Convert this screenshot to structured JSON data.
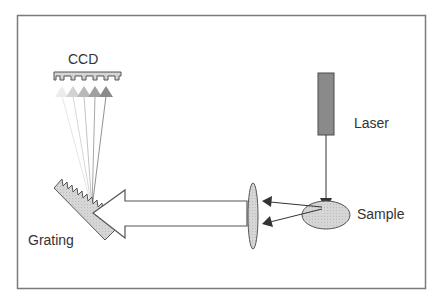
{
  "diagram": {
    "type": "raman-spectrometer-schematic",
    "labels": {
      "ccd": "CCD",
      "laser": "Laser",
      "sample": "Sample",
      "grating": "Grating"
    },
    "components": [
      {
        "id": "ccd",
        "shape": "toothed-bar",
        "label": "CCD"
      },
      {
        "id": "laser",
        "shape": "rectangle",
        "label": "Laser"
      },
      {
        "id": "sample",
        "shape": "ellipse",
        "label": "Sample"
      },
      {
        "id": "lens",
        "shape": "ellipse"
      },
      {
        "id": "grating",
        "shape": "sawtooth-plate",
        "label": "Grating"
      }
    ],
    "connections": [
      {
        "from": "laser",
        "to": "sample",
        "style": "arrow"
      },
      {
        "from": "sample",
        "to": "lens",
        "style": "two-arrows"
      },
      {
        "from": "lens",
        "to": "grating",
        "style": "block-arrow"
      },
      {
        "from": "grating",
        "to": "ccd",
        "style": "fan-of-5-arrows"
      }
    ],
    "colors": {
      "frame": "#777777",
      "fill_light": "#d0d0d0",
      "laser_fill": "#888888",
      "stroke": "#444444"
    }
  }
}
